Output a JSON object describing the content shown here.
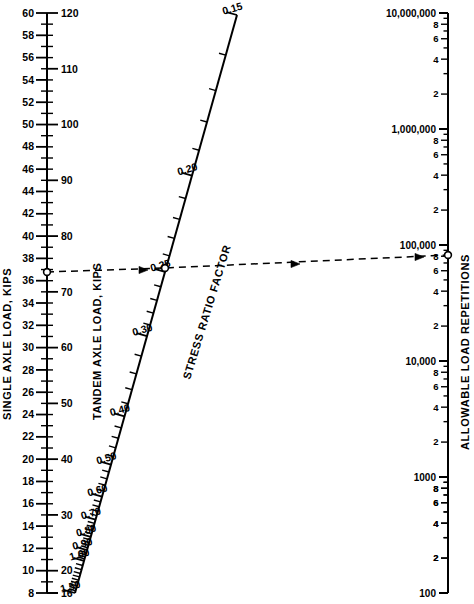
{
  "figure": {
    "background": "#ffffff",
    "ink": "#000000",
    "width": 474,
    "height": 604
  },
  "axes": {
    "left": {
      "name": "single-tandem-axle-load-axis",
      "primary_label": "SINGLE AXLE LOAD, KIPS",
      "secondary_label": "TANDEM AXLE LOAD, KIPS",
      "x": 47,
      "y_top": 13,
      "y_bottom": 593,
      "single": {
        "units": "kips",
        "min": 8,
        "max": 60,
        "major_step": 2,
        "labeled": [
          60,
          58,
          56,
          54,
          52,
          50,
          48,
          46,
          44,
          42,
          40,
          38,
          36,
          34,
          32,
          30,
          28,
          26,
          24,
          22,
          20,
          18,
          16,
          14,
          12,
          10,
          8
        ]
      },
      "tandem": {
        "units": "kips",
        "min": 16,
        "max": 120,
        "labeled": [
          120,
          110,
          100,
          90,
          80,
          70,
          60,
          50,
          40,
          30,
          20,
          16
        ],
        "minor_between": 5
      },
      "marker": {
        "single_value": 36,
        "tandem_value": 72
      }
    },
    "middle": {
      "name": "stress-ratio-factor-axis",
      "label": "STRESS RATIO FACTOR",
      "x_top": 237,
      "y_top": 15,
      "x_bottom": 75,
      "y_bottom": 593,
      "min": 0.15,
      "max": 1.5,
      "labeled": [
        "0.15",
        "0.20",
        "0.25",
        "0.30",
        "0.40",
        "0.50",
        "0.60",
        "0.70",
        "0.80",
        "0.90",
        "1.00",
        "1.50"
      ],
      "marker_value": "0.305"
    },
    "right": {
      "name": "allowable-load-repetitions-axis",
      "label": "ALLOWABLE LOAD REPETITIONS",
      "x": 448,
      "y_top": 13,
      "y_bottom": 593,
      "scale": "log",
      "min": 100,
      "max": 10000000,
      "decade_labels": [
        "10,000,000",
        "1,000,000",
        "100,000",
        "10,000",
        "1000",
        "100"
      ],
      "minor_labels": [
        "8",
        "6",
        "4",
        "2"
      ],
      "marker_value": 22000
    }
  },
  "isopleth": {
    "name": "solution-line",
    "style": "dashed",
    "points": [
      {
        "axis": "left",
        "label": "36",
        "x": 47,
        "y": 272
      },
      {
        "axis": "middle",
        "label": "0.305",
        "x": 165,
        "y": 268
      },
      {
        "axis": "right",
        "label": "22,000",
        "x": 448,
        "y": 255
      }
    ],
    "arrow_positions": [
      {
        "x": 148,
        "y": 270
      },
      {
        "x": 300,
        "y": 264
      },
      {
        "x": 424,
        "y": 257
      }
    ]
  },
  "chart_data": {
    "type": "table",
    "xlabel": "",
    "ylabel": "",
    "series": [
      {
        "name": "SINGLE AXLE LOAD, KIPS",
        "ticks": [
          60,
          58,
          56,
          54,
          52,
          50,
          48,
          46,
          44,
          42,
          40,
          38,
          36,
          34,
          32,
          30,
          28,
          26,
          24,
          22,
          20,
          18,
          16,
          14,
          12,
          10,
          8
        ]
      },
      {
        "name": "TANDEM AXLE LOAD, KIPS",
        "ticks": [
          120,
          110,
          100,
          90,
          80,
          70,
          60,
          50,
          40,
          30,
          20,
          16
        ]
      },
      {
        "name": "STRESS RATIO FACTOR",
        "ticks": [
          0.15,
          0.2,
          0.25,
          0.3,
          0.4,
          0.5,
          0.6,
          0.7,
          0.8,
          0.9,
          1.0,
          1.5
        ]
      },
      {
        "name": "ALLOWABLE LOAD REPETITIONS",
        "ticks": [
          100,
          1000,
          10000,
          100000,
          1000000,
          10000000
        ]
      }
    ],
    "reading_example": {
      "single_axle_load_kips": 36,
      "tandem_axle_load_kips": 72,
      "stress_ratio_factor": 0.305,
      "allowable_load_repetitions": 22000
    }
  }
}
